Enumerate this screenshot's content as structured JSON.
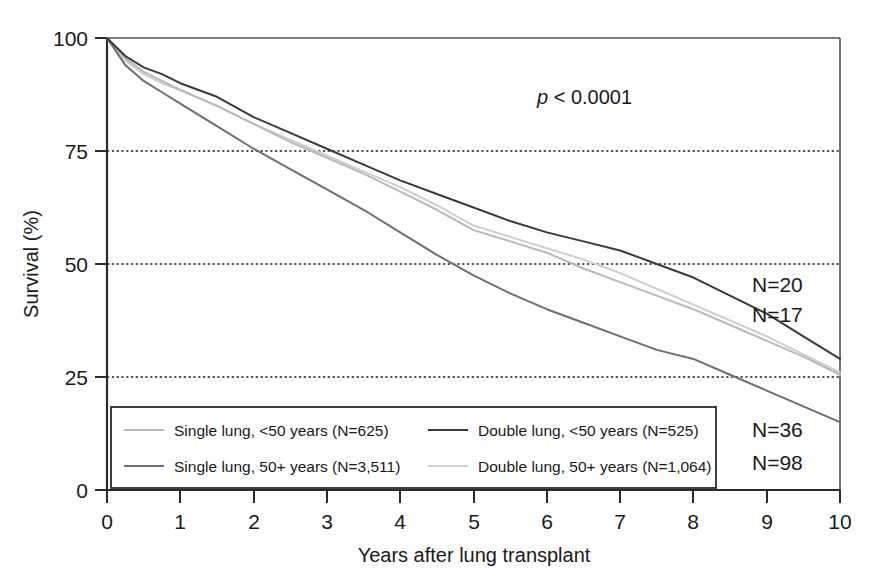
{
  "chart_data": {
    "type": "line",
    "title": "",
    "xlabel": "Years after lung transplant",
    "ylabel": "Survival (%)",
    "xlim": [
      0,
      10
    ],
    "ylim": [
      0,
      100
    ],
    "xticks": [
      "0",
      "1",
      "2",
      "3",
      "4",
      "5",
      "6",
      "7",
      "8",
      "9",
      "10"
    ],
    "yticks": [
      "0",
      "25",
      "50",
      "75",
      "100"
    ],
    "grid": "horizontal dotted at 25, 50, 75, 100",
    "legend_position": "inside bottom-left",
    "annotation_pvalue": "p < 0.0001",
    "x": [
      0,
      0.25,
      0.5,
      0.75,
      1,
      1.5,
      2,
      2.5,
      3,
      3.5,
      4,
      4.5,
      5,
      5.5,
      6,
      6.5,
      7,
      7.5,
      8,
      8.5,
      9,
      9.5,
      10
    ],
    "series": [
      {
        "name": "Single lung, <50 years",
        "n": 625,
        "legend_label": "Single lung, <50 years  (N=625)",
        "color": "#b9b9b9",
        "values": [
          100,
          95.5,
          92.5,
          90.5,
          88.5,
          85,
          81,
          77,
          73.5,
          70,
          66,
          62,
          57.5,
          55,
          52.5,
          49,
          46,
          43,
          40,
          36.5,
          33,
          29.5,
          25.5
        ]
      },
      {
        "name": "Single lung, 50+ years",
        "n": 3511,
        "legend_label": "Single lung, 50+ years  (N=3,511)",
        "color": "#6f6f6f",
        "values": [
          100,
          94,
          90.5,
          88,
          85.5,
          80.5,
          75.5,
          71,
          66.5,
          62,
          57,
          52,
          47.5,
          43.5,
          40,
          37,
          34,
          31,
          29,
          25.5,
          22,
          18.5,
          15
        ]
      },
      {
        "name": "Double lung, <50 years",
        "n": 525,
        "legend_label": "Double lung, <50 years  (N=525)",
        "color": "#3a3a3a",
        "values": [
          100,
          96,
          93.5,
          92,
          90,
          87,
          82.5,
          79,
          75.5,
          72,
          68.5,
          65.5,
          62.5,
          59.5,
          57,
          55,
          53,
          50,
          47,
          43,
          39,
          34,
          29
        ]
      },
      {
        "name": "Double lung, 50+ years",
        "n": 1064,
        "legend_label": "Double lung, 50+ years  (N=1,064)",
        "color": "#cfcfcf",
        "values": [
          100,
          95,
          92,
          90,
          88.5,
          85,
          81,
          77.5,
          74,
          70.5,
          67,
          63,
          58.5,
          56,
          53.5,
          51,
          48,
          44.5,
          41,
          37.5,
          34,
          30,
          26
        ]
      }
    ],
    "endpoint_labels": [
      {
        "text": "N=20",
        "series": "Double lung, <50 years"
      },
      {
        "text": "N=17",
        "series": "Double lung, 50+ years"
      },
      {
        "text": "N=36",
        "series": "Single lung, <50 years"
      },
      {
        "text": "N=98",
        "series": "Single lung, 50+ years"
      }
    ]
  },
  "axes": {
    "y_title": "Survival (%)",
    "x_title": "Years after lung transplant",
    "y_tick_0": "0",
    "y_tick_25": "25",
    "y_tick_50": "50",
    "y_tick_75": "75",
    "y_tick_100": "100",
    "x_tick_0": "0",
    "x_tick_1": "1",
    "x_tick_2": "2",
    "x_tick_3": "3",
    "x_tick_4": "4",
    "x_tick_5": "5",
    "x_tick_6": "6",
    "x_tick_7": "7",
    "x_tick_8": "8",
    "x_tick_9": "9",
    "x_tick_10": "10"
  },
  "annotations": {
    "pvalue_symbol": "p",
    "pvalue_rest": " < 0.0001",
    "n_top_1": "N=20",
    "n_top_2": "N=17",
    "n_bottom_1": "N=36",
    "n_bottom_2": "N=98"
  },
  "legend": {
    "items": [
      {
        "label": "Single lung, <50 years  (N=625)",
        "color": "#b9b9b9"
      },
      {
        "label": "Single lung, 50+ years  (N=3,511)",
        "color": "#6f6f6f"
      },
      {
        "label": "Double lung, <50 years  (N=525)",
        "color": "#3a3a3a"
      },
      {
        "label": "Double lung, 50+ years  (N=1,064)",
        "color": "#cfcfcf"
      }
    ]
  }
}
